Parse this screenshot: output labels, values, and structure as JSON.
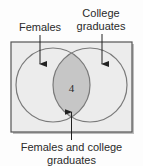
{
  "diagram": {
    "type": "venn",
    "sets": [
      {
        "id": "females",
        "label": "Females"
      },
      {
        "id": "college",
        "label_lines": [
          "College",
          "graduates"
        ]
      }
    ],
    "intersection": {
      "value": "4",
      "label_lines": [
        "Females and college",
        "graduates"
      ]
    },
    "colors": {
      "background": "#fdfdfd",
      "universe_fill": "#ececec",
      "universe_stroke": "#555555",
      "circle_stroke": "#7a7a7a",
      "intersection_fill": "#c6c6c6",
      "text": "#2a2a2a",
      "arrow": "#222222"
    }
  }
}
